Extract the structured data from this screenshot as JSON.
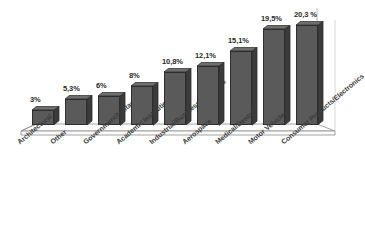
{
  "chart_data": {
    "type": "bar",
    "title": "",
    "subtitle": "",
    "xlabel": "",
    "ylabel": "",
    "grid": false,
    "legend": "none",
    "three_d": true,
    "ylim": [
      0,
      22
    ],
    "categories": [
      "Architectural",
      "Other",
      "Government/Military",
      "Academic Institutions",
      "Industrial/Business Machines",
      "Aerospace",
      "Medical/Dental",
      "Motor Vehicles",
      "Consumer Products/Electronics"
    ],
    "values": [
      3,
      5.3,
      6,
      8,
      10.8,
      12.1,
      15.1,
      19.5,
      20.3
    ],
    "data_labels": [
      "3%",
      "5,3%",
      "6%",
      "8%",
      "10,8%",
      "12,1%",
      "15,1%",
      "19,5%",
      "20,3 %"
    ],
    "colors": {
      "bar_front": "#5a5a5a",
      "bar_side": "#3b3b3b",
      "bar_top": "#6e6e6e",
      "bar_outline": "#2e2e2e",
      "floor": "#fdfdfd",
      "floor_outline": "#8d8d8d",
      "label_text": "#2b2b2b",
      "background": "#ffffff"
    }
  }
}
